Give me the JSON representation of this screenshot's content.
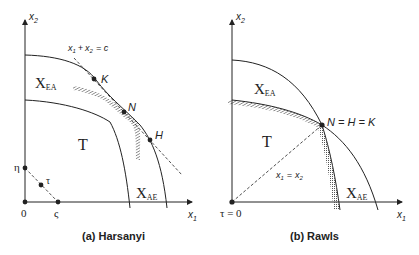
{
  "panels": [
    {
      "id": "harsanyi",
      "caption": "(a) Harsanyi",
      "axes": {
        "x": "x",
        "x_sub": "1",
        "y": "x",
        "y_sub": "2"
      },
      "regions": {
        "top_left": "X",
        "top_left_sub": "EA",
        "bottom_right": "X",
        "bottom_right_sub": "AE",
        "center": "T"
      },
      "line_label": {
        "a": "x",
        "a_sub": "1",
        "plus": "+",
        "b": "x",
        "b_sub": "2",
        "eq": "= c"
      },
      "points": {
        "K": "K",
        "N": "N",
        "H": "H",
        "eta": "η",
        "tau": "τ",
        "zeta": "ς",
        "origin": "0"
      }
    },
    {
      "id": "rawls",
      "caption": "(b) Rawls",
      "axes": {
        "x": "x",
        "x_sub": "1",
        "y": "x",
        "y_sub": "2"
      },
      "regions": {
        "top_left": "X",
        "top_left_sub": "EA",
        "bottom_right": "X",
        "bottom_right_sub": "AE",
        "center": "T"
      },
      "diag_label": {
        "a": "x",
        "a_sub": "1",
        "eq": "=",
        "b": "x",
        "b_sub": "2"
      },
      "points": {
        "NHK": "N = H = K",
        "origin": "τ = 0"
      }
    }
  ],
  "colors": {
    "ink": "#222222",
    "hatch": "#555555",
    "background": "#ffffff"
  }
}
